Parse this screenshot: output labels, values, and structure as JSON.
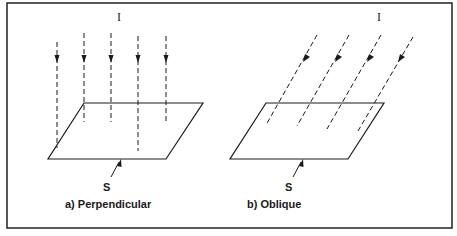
{
  "figure": {
    "border_color": "#222222",
    "line_color": "#1a1a1a",
    "panels": [
      {
        "id": "a",
        "incident_label": "I",
        "surface_label": "S",
        "caption": "a) Perpendicular",
        "ray_count": 5,
        "ray_direction": "vertical"
      },
      {
        "id": "b",
        "incident_label": "I",
        "surface_label": "S",
        "caption": "b) Oblique",
        "ray_count": 4,
        "ray_direction": "oblique"
      }
    ]
  }
}
